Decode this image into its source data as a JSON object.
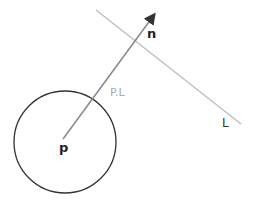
{
  "diagram": {
    "labels": {
      "point": "p",
      "normal": "n",
      "projection": "P.L",
      "line": "L"
    },
    "colors": {
      "circle": "#333333",
      "arrow": "#888888",
      "arrowhead": "#333333",
      "line": "#bbbbbb",
      "projection_label": "#aaaaaa",
      "text": "#222222"
    },
    "geometry": {
      "circle": {
        "cx": 65,
        "cy": 142,
        "r": 51
      },
      "arrow": {
        "x1": 63,
        "y1": 139,
        "x2": 155,
        "y2": 13
      },
      "line_L": {
        "x1": 96,
        "y1": 10,
        "x2": 241,
        "y2": 124
      }
    }
  }
}
